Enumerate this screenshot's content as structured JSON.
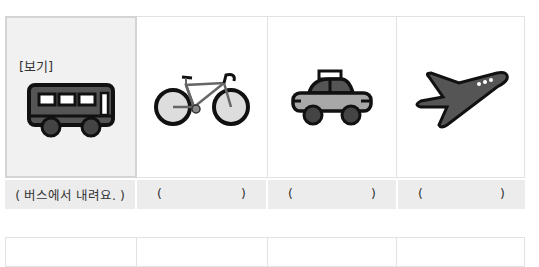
{
  "example_tag": "[보기]",
  "cards": [
    {
      "icon": "bus-icon",
      "label": "( 버스에서 내려요. )",
      "is_example": true
    },
    {
      "icon": "bicycle-icon",
      "open": "(",
      "close": ")"
    },
    {
      "icon": "taxi-icon",
      "open": "(",
      "close": ")"
    },
    {
      "icon": "airplane-icon",
      "open": "(",
      "close": ")"
    }
  ],
  "colors": {
    "icon_fill_dark": "#555555",
    "icon_fill_light": "#a8a8a8",
    "outline": "#111111",
    "label_bg": "#ececec",
    "example_bg": "#f1f1f1"
  }
}
